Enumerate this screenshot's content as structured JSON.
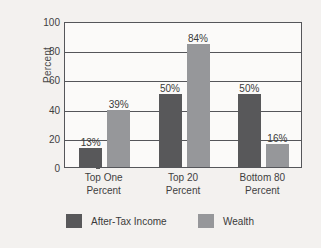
{
  "chart_data": {
    "type": "bar",
    "title": "",
    "xlabel": "",
    "ylabel": "Percent",
    "ylim": [
      0,
      100
    ],
    "yticks": [
      0,
      20,
      40,
      60,
      80,
      100
    ],
    "ytick_labels": [
      "0",
      "20",
      "40",
      "60",
      "80",
      "100"
    ],
    "grid": true,
    "legend_position": "bottom",
    "categories": [
      "Top One Percent",
      "Top 20 Percent",
      "Bottom 80 Percent"
    ],
    "category_lines": [
      [
        "Top One",
        "Percent"
      ],
      [
        "Top 20",
        "Percent"
      ],
      [
        "Bottom 80",
        "Percent"
      ]
    ],
    "series": [
      {
        "name": "After-Tax Income",
        "color": "#58585a",
        "values": [
          13,
          50,
          50
        ],
        "data_labels": [
          "13%",
          "50%",
          "50%"
        ]
      },
      {
        "name": "Wealth",
        "color": "#96979a",
        "values": [
          39,
          84,
          16
        ],
        "data_labels": [
          "39%",
          "84%",
          "16%"
        ]
      }
    ]
  },
  "legend": {
    "items": [
      {
        "label": "After-Tax Income",
        "swatch": "income"
      },
      {
        "label": "Wealth",
        "swatch": "wealth"
      }
    ]
  },
  "colors": {
    "background": "#f3f1ef",
    "plot_background": "#fbfaf9",
    "axis": "#55565a",
    "income": "#58585a",
    "wealth": "#96979a",
    "text": "#3a3a3a"
  }
}
